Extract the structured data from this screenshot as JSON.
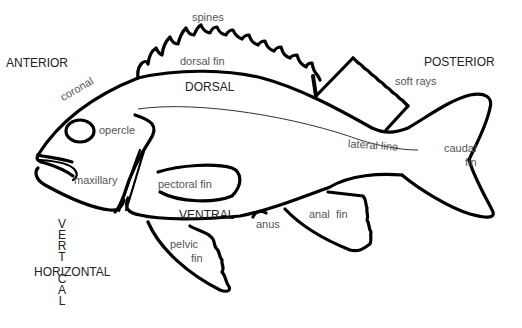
{
  "diagram": {
    "orientation": {
      "anterior": "ANTERIOR",
      "posterior": "POSTERIOR",
      "dorsal": "DORSAL",
      "ventral": "VENTRAL",
      "horizontal": "HORIZONTAL",
      "vertical_letters": [
        "V",
        "E",
        "R",
        "T",
        "I",
        "C",
        "A",
        "L"
      ]
    },
    "labels": {
      "spines": "spines",
      "dorsal_fin": "dorsal fin",
      "soft_rays": "soft rays",
      "coronal": "coronal",
      "opercle": "opercle",
      "lateral_line": "lateral line",
      "caudal": "caudal",
      "fin_caudal": "fin",
      "maxillary": "maxillary",
      "pectoral_fin": "pectoral fin",
      "anus": "anus",
      "anal_fin": "anal  fin",
      "pelvic": "pelvic",
      "fin_pelvic": "fin"
    },
    "colors": {
      "stroke": "#000000",
      "label_text": "#555555",
      "caps_text": "#222222",
      "background": "#ffffff"
    }
  }
}
